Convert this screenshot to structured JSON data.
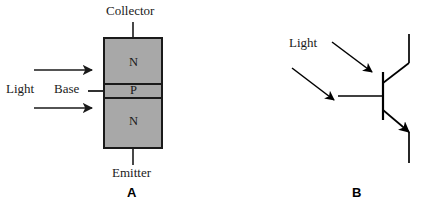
{
  "figure": {
    "background_color": "#ffffff",
    "ink_color": "#1a1a1a",
    "fill_color": "#a8a8a8",
    "width": 425,
    "height": 211
  },
  "panel_a": {
    "letter": "A",
    "caption_letter_name": "panel-a-letter",
    "device_name": "phototransistor-cross-section",
    "terminals": {
      "collector": "Collector",
      "base": "Base",
      "emitter": "Emitter"
    },
    "layers": [
      {
        "name": "collector-region",
        "label": "N",
        "type": "N"
      },
      {
        "name": "base-region",
        "label": "P",
        "type": "P"
      },
      {
        "name": "emitter-region",
        "label": "N",
        "type": "N"
      }
    ],
    "light": {
      "label": "Light",
      "ray_count": 2,
      "direction": "rightward"
    }
  },
  "panel_b": {
    "letter": "B",
    "caption_letter_name": "panel-b-letter",
    "device_name": "phototransistor-schematic-symbol",
    "symbol_type": "NPN transistor",
    "light": {
      "label": "Light",
      "ray_count": 2,
      "direction": "down-right"
    }
  }
}
